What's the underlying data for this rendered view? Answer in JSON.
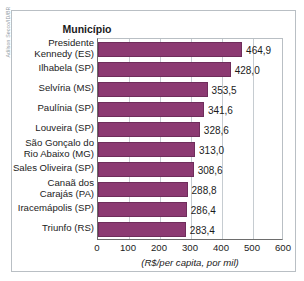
{
  "credit": "Adilson Secco/ID/BR",
  "header": {
    "category_column_label": "Município"
  },
  "colors": {
    "bar_fill": "#8c3a72",
    "bar_stroke": "#6f2d5b",
    "frame": "#b9bfc4",
    "gridline": "#c6ccd1",
    "axis": "#6d6d6d",
    "text": "#1b1b1b",
    "credit_text": "#8d99a3"
  },
  "chart_data": {
    "type": "bar",
    "orientation": "horizontal",
    "title": "",
    "subtitle": "",
    "xlabel": "(R$/per capita, por mil)",
    "ylabel": "Município",
    "xlim": [
      0,
      600
    ],
    "xticks": [
      0,
      100,
      200,
      300,
      400,
      500,
      600
    ],
    "xtick_labels": [
      "0",
      "100",
      "200",
      "300",
      "400",
      "500",
      "600"
    ],
    "grid": true,
    "legend": null,
    "categories": [
      "Presidente Kennedy (ES)",
      "Ilhabela (SP)",
      "Selvíria (MS)",
      "Paulínia (SP)",
      "Louveira (SP)",
      "São Gonçalo do Rio Abaixo (MG)",
      "Sales Oliveira (SP)",
      "Canaã dos Carajás (PA)",
      "Iracemápolis (SP)",
      "Triunfo (RS)"
    ],
    "values": [
      464.9,
      428.0,
      353.5,
      341.6,
      328.6,
      313.0,
      308.6,
      288.8,
      286.4,
      283.4
    ],
    "value_labels": [
      "464,9",
      "428,0",
      "353,5",
      "341,6",
      "328,6",
      "313,0",
      "308,6",
      "288,8",
      "286,4",
      "283,4"
    ]
  },
  "rows": [
    {
      "label_line1": "Presidente",
      "label_line2": "Kennedy (ES)",
      "value": 464.9,
      "value_label": "464,9"
    },
    {
      "label_line1": "Ilhabela (SP)",
      "label_line2": "",
      "value": 428.0,
      "value_label": "428,0"
    },
    {
      "label_line1": "Selvíria (MS)",
      "label_line2": "",
      "value": 353.5,
      "value_label": "353,5"
    },
    {
      "label_line1": "Paulínia (SP)",
      "label_line2": "",
      "value": 341.6,
      "value_label": "341,6"
    },
    {
      "label_line1": "Louveira (SP)",
      "label_line2": "",
      "value": 328.6,
      "value_label": "328,6"
    },
    {
      "label_line1": "São Gonçalo do",
      "label_line2": "Rio Abaixo (MG)",
      "value": 313.0,
      "value_label": "313,0"
    },
    {
      "label_line1": "Sales Oliveira (SP)",
      "label_line2": "",
      "value": 308.6,
      "value_label": "308,6"
    },
    {
      "label_line1": "Canaã dos",
      "label_line2": "Carajás (PA)",
      "value": 288.8,
      "value_label": "288,8"
    },
    {
      "label_line1": "Iracemápolis (SP)",
      "label_line2": "",
      "value": 286.4,
      "value_label": "286,4"
    },
    {
      "label_line1": "Triunfo (RS)",
      "label_line2": "",
      "value": 283.4,
      "value_label": "283,4"
    }
  ]
}
